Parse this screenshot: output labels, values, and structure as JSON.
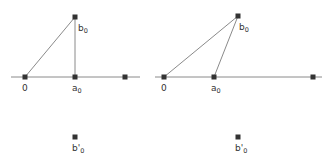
{
  "colors": {
    "line": "#8a8a8a",
    "point": "#333333",
    "text": "#333333",
    "background": "#ffffff"
  },
  "figures": [
    {
      "name": "left",
      "axis": {
        "x1": 11,
        "x2": 140,
        "y": 77
      },
      "points": {
        "origin": {
          "x": 25,
          "y": 77,
          "label": "0"
        },
        "a0": {
          "x": 75,
          "y": 77,
          "label": "a",
          "sub": "0"
        },
        "right": {
          "x": 125,
          "y": 77
        },
        "b0": {
          "x": 75,
          "y": 17,
          "label": "b",
          "sub": "0"
        },
        "b0prime": {
          "x": 75,
          "y": 137,
          "label": "b'",
          "sub": "0"
        }
      }
    },
    {
      "name": "right",
      "axis": {
        "x1": 155,
        "x2": 322,
        "y": 77
      },
      "points": {
        "origin": {
          "x": 164,
          "y": 77,
          "label": "0"
        },
        "a0": {
          "x": 214,
          "y": 77,
          "label": "a",
          "sub": "0"
        },
        "right": {
          "x": 313,
          "y": 77
        },
        "b0": {
          "x": 238,
          "y": 16,
          "label": "b",
          "sub": "0"
        },
        "b0prime": {
          "x": 238,
          "y": 137,
          "label": "b'",
          "sub": "0"
        }
      }
    }
  ]
}
